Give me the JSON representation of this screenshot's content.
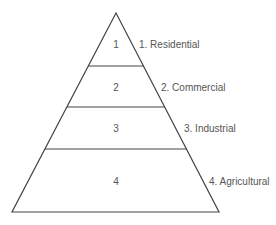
{
  "diagram": {
    "type": "pyramid",
    "tiers": [
      {
        "number": "1",
        "label": "1.  Residential"
      },
      {
        "number": "2",
        "label": "2.  Commercial"
      },
      {
        "number": "3",
        "label": "3.  Industrial"
      },
      {
        "number": "4",
        "label": "4.  Agricultural"
      }
    ]
  }
}
